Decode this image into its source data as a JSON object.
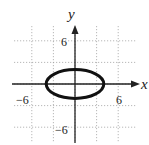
{
  "chart_data": {
    "type": "line",
    "title": "",
    "xlabel": "x",
    "ylabel": "y",
    "xlim": [
      -9,
      9
    ],
    "ylim": [
      -9,
      9
    ],
    "grid": true,
    "grid_step": 1.5,
    "tick_labels": {
      "x": [
        {
          "value": -6,
          "label": "−6"
        },
        {
          "value": 6,
          "label": "6"
        }
      ],
      "y": [
        {
          "value": 6,
          "label": "6"
        },
        {
          "value": -6,
          "label": "−6"
        }
      ]
    },
    "series": [
      {
        "name": "ellipse",
        "equation": "x^2/16 + y^2/4 = 1",
        "center": [
          0,
          0
        ],
        "semi_major_x": 4,
        "semi_minor_y": 2,
        "color": "#111111"
      }
    ]
  },
  "labels": {
    "x_axis": "x",
    "y_axis": "y",
    "x_neg": "−6",
    "x_pos": "6",
    "y_pos": "6",
    "y_neg": "−6"
  }
}
